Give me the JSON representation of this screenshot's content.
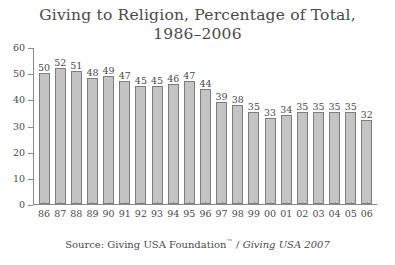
{
  "chart_data": {
    "type": "bar",
    "title": "Giving to Religion, Percentage of Total, 1986–2006",
    "title_lines": [
      "Giving to Religion, Percentage of Total,",
      "1986–2006"
    ],
    "xlabel": "",
    "ylabel": "",
    "ylim": [
      0,
      60
    ],
    "yticks": [
      60,
      50,
      40,
      30,
      20,
      10,
      0
    ],
    "grid": false,
    "legend": null,
    "categories": [
      "86",
      "87",
      "88",
      "89",
      "90",
      "91",
      "92",
      "93",
      "94",
      "95",
      "96",
      "97",
      "98",
      "99",
      "00",
      "01",
      "02",
      "03",
      "04",
      "05",
      "06"
    ],
    "values": [
      50,
      52,
      51,
      48,
      49,
      47,
      45,
      45,
      46,
      47,
      44,
      39,
      38,
      35,
      33,
      34,
      35,
      35,
      35,
      35,
      32
    ],
    "bar_color": "#c4c4c4",
    "bar_edge_color": "#7d7d7d",
    "axis_color": "#8a8a8a",
    "text_color": "#4a4a4a"
  },
  "source": {
    "prefix": "Source: Giving USA Foundation",
    "trademark": "™",
    "separator": " / ",
    "publication": "Giving USA 2007"
  }
}
